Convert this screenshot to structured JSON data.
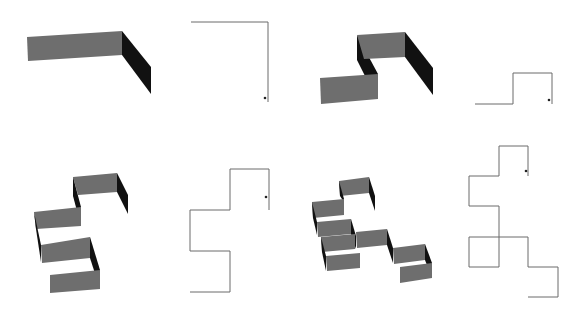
{
  "figure": {
    "width": 579,
    "height": 312,
    "colors": {
      "background": "#ffffff",
      "wall_face": "#6e6e6e",
      "wall_side": "#111111",
      "path_line": "#6a6a6a",
      "start_dot": "#222222"
    },
    "pairs": [
      {
        "id": "pair-1",
        "walls": [
          {
            "shade": "face",
            "points": "27,37 122,31 122,55 28,61"
          },
          {
            "shade": "side",
            "points": "122,31 151,67 151,94 122,55"
          }
        ],
        "path": "191,22 268,22 268,102",
        "dot": [
          265,
          98
        ]
      },
      {
        "id": "pair-2",
        "walls": [
          {
            "shade": "side",
            "points": "357,35 378,74 378,78 366,78 357,60"
          },
          {
            "shade": "face",
            "points": "357,35 405,32 405,57 364,59"
          },
          {
            "shade": "face",
            "points": "320,78 378,74 378,99 321,104"
          },
          {
            "shade": "side",
            "points": "405,32 433,68 433,95 405,57"
          }
        ],
        "path": "475,104 513,104 513,73 552,73 552,104",
        "dot": [
          549,
          100
        ]
      },
      {
        "id": "pair-3",
        "walls": [
          {
            "shade": "face",
            "points": "73,177 117,173 117,192 78,195"
          },
          {
            "shade": "side",
            "points": "117,173 128,195 128,214 117,192"
          },
          {
            "shade": "side",
            "points": "73,177 81,207 81,211 77,211 73,196"
          },
          {
            "shade": "face",
            "points": "34,212 81,207 81,226 36,229"
          },
          {
            "shade": "side",
            "points": "34,212 41,245 41,262 36,229"
          },
          {
            "shade": "face",
            "points": "41,245 90,237 90,258 42,263"
          },
          {
            "shade": "side",
            "points": "90,237 100,270 100,289 90,258"
          },
          {
            "shade": "face",
            "points": "50,275 100,270 100,289 50,293"
          }
        ],
        "path": "190,292 230,292 230,251 190,251 190,210 230,210 230,169 269,169 269,210",
        "dot": [
          266,
          197
        ]
      },
      {
        "id": "pair-4",
        "walls": [
          {
            "shade": "face",
            "points": "339,181 369,177 369,193 340,196"
          },
          {
            "shade": "side",
            "points": "369,177 375,196 375,211 369,193"
          },
          {
            "shade": "side",
            "points": "339,181 344,199 344,202 340,196"
          },
          {
            "shade": "face",
            "points": "312,202 344,199 344,215 313,218"
          },
          {
            "shade": "side",
            "points": "312,202 317,222 317,235 313,218"
          },
          {
            "shade": "face",
            "points": "317,222 351,219 351,234 318,237"
          },
          {
            "shade": "side",
            "points": "351,219 356,236 356,249 351,234"
          },
          {
            "shade": "face",
            "points": "321,237 355,234 355,249 322,252"
          },
          {
            "shade": "side",
            "points": "321,237 326,256 326,271 322,252"
          },
          {
            "shade": "face",
            "points": "326,256 360,253 360,268 327,271"
          },
          {
            "shade": "face",
            "points": "356,232 387,229 387,245 357,248"
          },
          {
            "shade": "side",
            "points": "387,229 393,248 393,263 387,245"
          },
          {
            "shade": "face",
            "points": "393,248 425,244 425,260 394,264"
          },
          {
            "shade": "side",
            "points": "425,244 432,263 432,278 425,260"
          },
          {
            "shade": "face",
            "points": "400,267 432,263 432,278 400,283"
          }
        ],
        "path": "528,176 528,146 499,146 499,176 469,176 469,206 499,206 499,267 469,267 469,237 528,237 528,267 558,267 558,297 528,297",
        "dot": [
          526,
          171
        ]
      }
    ]
  }
}
